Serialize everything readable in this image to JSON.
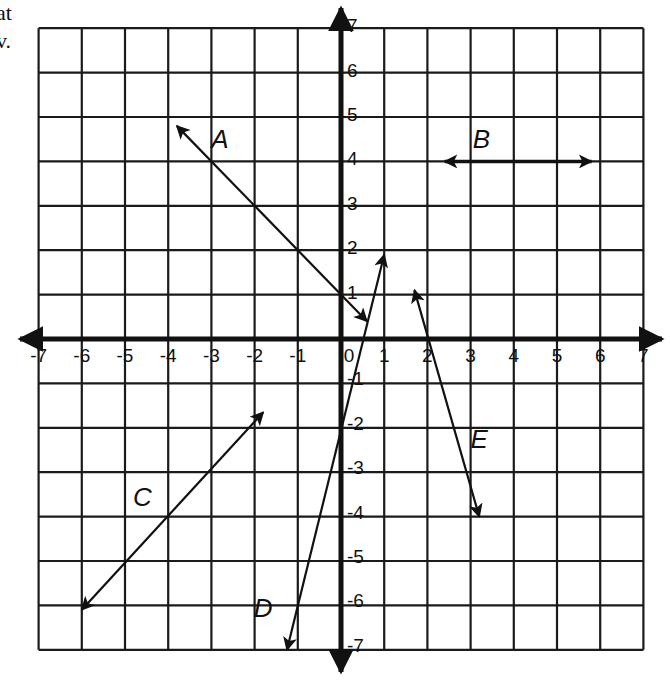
{
  "page": {
    "cropped_text": [
      "at",
      "v."
    ]
  },
  "chart_data": {
    "type": "coordinate-plane",
    "title": "",
    "xlabel": "",
    "ylabel": "",
    "xlim": [
      -7,
      7
    ],
    "ylim": [
      -7,
      7
    ],
    "grid": true,
    "x_ticks": [
      -7,
      -6,
      -5,
      -4,
      -3,
      -2,
      -1,
      0,
      1,
      2,
      3,
      4,
      5,
      6,
      7
    ],
    "y_ticks": [
      -7,
      -6,
      -5,
      -4,
      -3,
      -2,
      -1,
      1,
      2,
      3,
      4,
      5,
      6,
      7
    ],
    "origin_label": "0",
    "lines": [
      {
        "name": "A",
        "from": [
          -3.8,
          4.8
        ],
        "to": [
          0.6,
          0.4
        ],
        "arrows": "both",
        "passes_through": [
          [
            -3,
            4
          ],
          [
            -2,
            3
          ],
          [
            -1,
            2
          ],
          [
            0,
            1
          ]
        ],
        "slope": -1,
        "label_pos": [
          -2.8,
          4.3
        ]
      },
      {
        "name": "B",
        "from": [
          2.4,
          4
        ],
        "to": [
          5.8,
          4
        ],
        "arrows": "both",
        "passes_through": [
          [
            3,
            4
          ],
          [
            4,
            4
          ],
          [
            5,
            4
          ]
        ],
        "slope": 0,
        "label_pos": [
          3.25,
          4.3
        ]
      },
      {
        "name": "C",
        "from": [
          -6,
          -6.1
        ],
        "to": [
          -1.8,
          -1.65
        ],
        "arrows": "both",
        "passes_through": [
          [
            -6,
            -6
          ],
          [
            -5,
            -5
          ],
          [
            -4,
            -4
          ],
          [
            -3,
            -3
          ],
          [
            -2,
            -2
          ]
        ],
        "slope": 1,
        "label_pos": [
          -4.6,
          -3.75
        ]
      },
      {
        "name": "D",
        "from": [
          -1.25,
          -7
        ],
        "to": [
          1.0,
          1.9
        ],
        "arrows": "both",
        "passes_through": [
          [
            0,
            -2
          ],
          [
            1,
            2
          ]
        ],
        "slope": 4,
        "label_pos": [
          -1.8,
          -6.25
        ]
      },
      {
        "name": "E",
        "from": [
          1.7,
          1.1
        ],
        "to": [
          3.2,
          -4.0
        ],
        "arrows": "both",
        "passes_through": [
          [
            2,
            0
          ],
          [
            3,
            -4
          ]
        ],
        "slope": -4,
        "label_pos": [
          3.2,
          -2.45
        ]
      }
    ]
  }
}
